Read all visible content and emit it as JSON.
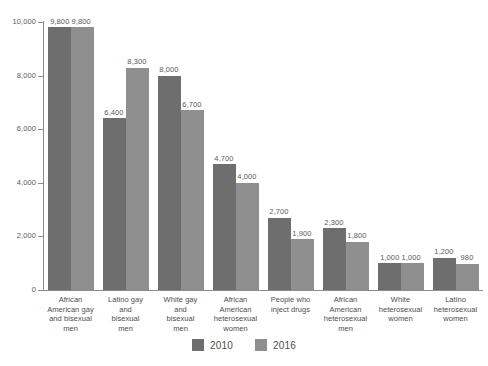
{
  "chart_data": {
    "type": "bar",
    "title": "",
    "subtitle": "",
    "xlabel": "",
    "ylabel": "",
    "ylim": [
      0,
      10000
    ],
    "yticks": [
      "0",
      "2,000",
      "4,000",
      "6,000",
      "8,000",
      "10,000"
    ],
    "ytick_values": [
      0,
      2000,
      4000,
      6000,
      8000,
      10000
    ],
    "grid": false,
    "legend_position": "bottom",
    "categories": [
      "African American gay and bisexual men",
      "Latino gay and bisexual men",
      "White gay and bisexual men",
      "African American heterosexual women",
      "People who inject drugs",
      "African American heterosexual men",
      "White heterosexual women",
      "Latino heterosexual women"
    ],
    "category_lines": [
      [
        "African",
        "American gay",
        "and bisexual",
        "men"
      ],
      [
        "Latino gay",
        "and",
        "bisexual",
        "men"
      ],
      [
        "White gay",
        "and",
        "bisexual",
        "men"
      ],
      [
        "African",
        "American",
        "heterosexual",
        "women"
      ],
      [
        "People who",
        "inject drugs"
      ],
      [
        "African",
        "American",
        "heterosexual",
        "men"
      ],
      [
        "White",
        "heterosexual",
        "women"
      ],
      [
        "Latino",
        "heterosexual",
        "women"
      ]
    ],
    "series": [
      {
        "name": "2010",
        "color": "#6e6e6e",
        "values": [
          9800,
          6400,
          8000,
          4700,
          2700,
          2300,
          1000,
          1200
        ],
        "labels": [
          "9,800",
          "6,400",
          "8,000",
          "4,700",
          "2,700",
          "2,300",
          "1,000",
          "1,200"
        ]
      },
      {
        "name": "2016",
        "color": "#8f8f8f",
        "values": [
          9800,
          8300,
          6700,
          4000,
          1900,
          1800,
          1000,
          980
        ],
        "labels": [
          "9,800",
          "8,300",
          "6,700",
          "4,000",
          "1,900",
          "1,800",
          "1,000",
          "980"
        ]
      }
    ]
  },
  "legend": {
    "items": [
      {
        "label": "2010",
        "color": "#6e6e6e"
      },
      {
        "label": "2016",
        "color": "#8f8f8f"
      }
    ]
  },
  "colors": {
    "series_2010": "#6e6e6e",
    "series_2016": "#8f8f8f",
    "axis": "#8c8c8c",
    "text": "#4d4d4d",
    "background": "#ffffff"
  }
}
